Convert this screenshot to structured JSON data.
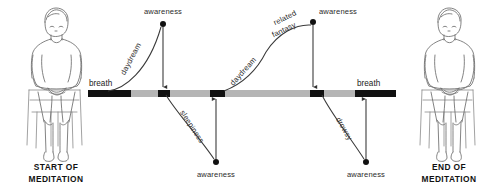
{
  "captions": {
    "left": {
      "line1": "START OF",
      "line2": "MEDITATION"
    },
    "right": {
      "line1": "END OF",
      "line2": "MEDITATION"
    }
  },
  "figures": {
    "left": {
      "name": "seated-meditator-start",
      "alt": "Person seated on chair in meditation posture"
    },
    "right": {
      "name": "seated-meditator-end",
      "alt": "Person seated on chair in meditation posture"
    }
  },
  "timeline": {
    "label_start": "breath",
    "label_end": "breath",
    "colors": {
      "breath": "#111111",
      "distraction": "#b5b5b5"
    },
    "segments": [
      {
        "kind": "breath",
        "x": 88,
        "width": 43
      },
      {
        "kind": "distraction",
        "x": 131,
        "width": 27
      },
      {
        "kind": "breath",
        "x": 158,
        "width": 12
      },
      {
        "kind": "distraction",
        "x": 170,
        "width": 40
      },
      {
        "kind": "breath",
        "x": 210,
        "width": 15
      },
      {
        "kind": "distraction",
        "x": 225,
        "width": 85
      },
      {
        "kind": "breath",
        "x": 310,
        "width": 14
      },
      {
        "kind": "distraction",
        "x": 324,
        "width": 31
      },
      {
        "kind": "breath",
        "x": 355,
        "width": 41
      }
    ],
    "y": 90,
    "height": 7
  },
  "episodes": [
    {
      "id": "daydream-up-1",
      "label": "daydream",
      "direction": "up",
      "wander_label_lines": [
        "daydream"
      ],
      "awareness_label": "awareness",
      "dot": {
        "x": 163,
        "y": 24
      },
      "return_to_x": 163
    },
    {
      "id": "sleepiness-down-1",
      "label": "sleepiness",
      "direction": "down",
      "wander_label_lines": [
        "sleepiness"
      ],
      "awareness_label": "awareness",
      "dot": {
        "x": 216,
        "y": 162
      },
      "return_to_x": 216
    },
    {
      "id": "daydream-fantasy-up-2",
      "label": "daydream",
      "direction": "up",
      "wander_label_lines": [
        "daydream",
        "related",
        "fantasy"
      ],
      "awareness_label": "awareness",
      "dot": {
        "x": 313,
        "y": 22
      },
      "return_to_x": 313
    },
    {
      "id": "drowsy-down-2",
      "label": "drowsy",
      "direction": "down",
      "wander_label_lines": [
        "drowsy"
      ],
      "awareness_label": "awareness",
      "dot": {
        "x": 366,
        "y": 162
      },
      "return_to_x": 366
    }
  ],
  "labels": {
    "awareness_top_left": "awareness",
    "awareness_top_right": "awareness",
    "awareness_bottom_left": "awareness",
    "awareness_bottom_right": "awareness",
    "daydream_1": "daydream",
    "sleepiness_1": "sleepiness",
    "daydream_2": "daydream",
    "related_fantasy_line1": "related",
    "related_fantasy_line2": "fantasy",
    "drowsy_1": "drowsy",
    "breath_left": "breath",
    "breath_right": "breath"
  }
}
